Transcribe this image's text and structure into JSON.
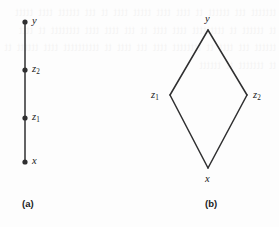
{
  "page": {
    "background_color": "#fdfdfd",
    "ink_color": "#2f2f30",
    "width": 279,
    "height": 227
  },
  "bleed_through_text": "ttttttt ttt tttttt tt tttt tttt ttttt tttt tt ttt tttttt tttt ttttt tt tttttt tt ttttttttt tttt tttt tt ttt tttt tttt tttttttt tt tttt tttttt ttt tttt tt tttttttt tttt ttt tttt tt tttttttttt tttt tttttt tt tt ttttttt tt tttttt",
  "figures": [
    {
      "id": "figure-a",
      "caption": "(a)",
      "type": "chain",
      "description": "vertical chain of four points",
      "nodes": [
        {
          "id": "y",
          "label": "y",
          "subscript": "",
          "x": 25,
          "y": 22,
          "label_x": 32,
          "label_y": 16,
          "dot": true
        },
        {
          "id": "z2",
          "label": "z",
          "subscript": "2",
          "x": 25,
          "y": 70,
          "label_x": 32,
          "label_y": 64,
          "dot": true
        },
        {
          "id": "z1",
          "label": "z",
          "subscript": "1",
          "x": 25,
          "y": 118,
          "label_x": 32,
          "label_y": 112,
          "dot": true
        },
        {
          "id": "x",
          "label": "x",
          "subscript": "",
          "x": 25,
          "y": 162,
          "label_x": 32,
          "label_y": 156,
          "dot": true
        }
      ],
      "edges": [
        {
          "from": "y",
          "to": "z2"
        },
        {
          "from": "z2",
          "to": "z1"
        },
        {
          "from": "z1",
          "to": "x"
        }
      ],
      "caption_x": 22,
      "caption_y": 199
    },
    {
      "id": "figure-b",
      "caption": "(b)",
      "type": "diamond",
      "description": "diamond lattice of four points",
      "nodes": [
        {
          "id": "y",
          "label": "y",
          "subscript": "",
          "x": 208,
          "y": 30,
          "label_x": 205,
          "label_y": 14,
          "dot": false
        },
        {
          "id": "z1",
          "label": "z",
          "subscript": "1",
          "x": 170,
          "y": 95,
          "label_x": 151,
          "label_y": 90,
          "dot": false
        },
        {
          "id": "z2",
          "label": "z",
          "subscript": "2",
          "x": 247,
          "y": 95,
          "label_x": 253,
          "label_y": 90,
          "dot": false
        },
        {
          "id": "x",
          "label": "x",
          "subscript": "",
          "x": 208,
          "y": 168,
          "label_x": 205,
          "label_y": 174,
          "dot": false
        }
      ],
      "edges": [
        {
          "from": "y",
          "to": "z1"
        },
        {
          "from": "y",
          "to": "z2"
        },
        {
          "from": "z1",
          "to": "x"
        },
        {
          "from": "z2",
          "to": "x"
        }
      ],
      "caption_x": 205,
      "caption_y": 199
    }
  ]
}
